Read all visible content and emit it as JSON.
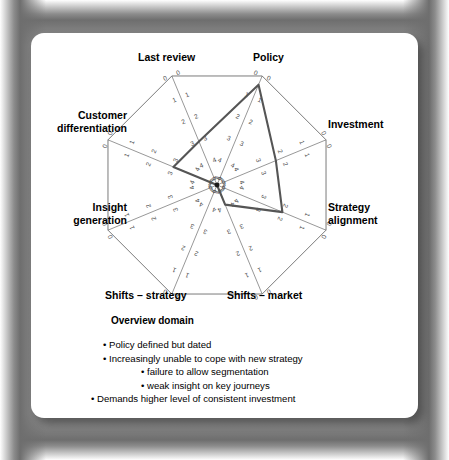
{
  "card": {
    "title": "Overview domain"
  },
  "chart_data": {
    "type": "radar",
    "title": "Overview domain",
    "scale_direction": "0 at outer edge, 5 at center",
    "tick_labels": [
      "0",
      "1",
      "2",
      "3",
      "4",
      "5"
    ],
    "rmin": 0,
    "rmax": 5,
    "grid": false,
    "legend": "none",
    "categories": [
      "Policy",
      "Investment",
      "Strategy alignment",
      "Shifts – market",
      "Shifts – strategy",
      "Insight generation",
      "Customer differentiation",
      "Last review"
    ],
    "series": [
      {
        "name": "Overview domain assessment",
        "values": [
          0.4,
          2.3,
          2.0,
          4.1,
          5.0,
          5.0,
          3.0,
          3.0
        ],
        "color": "#555555"
      }
    ]
  },
  "axis_labels": {
    "policy": "Policy",
    "investment": "Investment",
    "strategy_alignment_line1": "Strategy",
    "strategy_alignment_line2": "alignment",
    "shifts_market": "Shifts – market",
    "shifts_strategy": "Shifts – strategy",
    "insight_generation_line1": "Insight",
    "insight_generation_line2": "generation",
    "customer_differentiation_line1": "Customer",
    "customer_differentiation_line2": "differentiation",
    "last_review": "Last review"
  },
  "bullets": [
    "• Policy defined but dated",
    "• Increasingly unable to cope with new strategy",
    "• failure to allow segmentation",
    "• weak insight on key journeys",
    "• Demands higher level of consistent investment"
  ],
  "colors": {
    "card_background": "#ffffff",
    "frame": "#9a9a9a",
    "axis_line": "#6b6b6b",
    "data_line": "#555555",
    "text": "#000000",
    "scale_number": "#4a4a4a"
  }
}
